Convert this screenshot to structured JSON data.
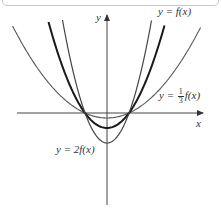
{
  "figure": {
    "axes": {
      "x_label": "x",
      "y_label": "y"
    },
    "curves": [
      {
        "id": "f",
        "label": "y = f(x)",
        "stroke": "#1a1a1a",
        "width": 2.0,
        "vertex_depth_px": 15
      },
      {
        "id": "third_f",
        "label_prefix": "y = ",
        "label_num": "1",
        "label_den": "3",
        "label_suffix": "f(x)",
        "stroke": "#555555",
        "width": 1.1,
        "vertex_depth_px": 5
      },
      {
        "id": "two_f",
        "label": "y = 2f(x)",
        "stroke": "#444444",
        "width": 1.2,
        "vertex_depth_px": 30
      }
    ],
    "colors": {
      "axis": "#444444",
      "background": "#ffffff"
    }
  }
}
